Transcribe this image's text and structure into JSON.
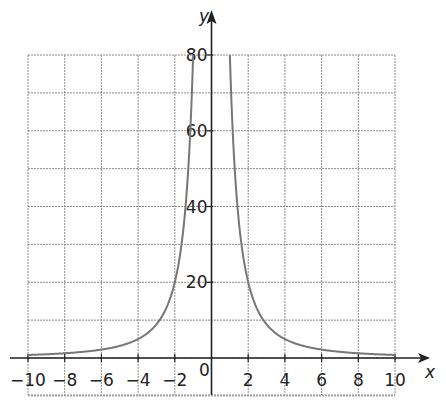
{
  "chart_data": {
    "type": "line",
    "title": "",
    "xlabel": "x",
    "ylabel": "y",
    "xlim": [
      -10,
      10
    ],
    "ylim": [
      -10,
      80
    ],
    "grid": true,
    "x_ticks": [
      -10,
      -8,
      -6,
      -4,
      -2,
      2,
      4,
      6,
      8,
      10
    ],
    "x_tick_labels": [
      "−10",
      "−8",
      "−6",
      "−4",
      "−2",
      "2",
      "4",
      "6",
      "8",
      "10"
    ],
    "y_ticks": [
      20,
      40,
      60,
      80
    ],
    "y_tick_labels": [
      "20",
      "40",
      "60",
      "80"
    ],
    "origin_label": "0",
    "function": "y = 80/x^2",
    "series": [
      {
        "name": "y = 80/x²",
        "x": [
          -10,
          -8,
          -6,
          -5,
          -4,
          -3,
          -2,
          -1.5,
          -1,
          1,
          1.5,
          2,
          3,
          4,
          5,
          6,
          8,
          10
        ],
        "y": [
          0.8,
          1.25,
          2.22,
          3.2,
          5,
          8.89,
          20,
          35.6,
          80,
          80,
          35.6,
          20,
          8.89,
          5,
          3.2,
          2.22,
          1.25,
          0.8
        ]
      }
    ],
    "colors": {
      "curve": "#777777",
      "grid": "#8a8a8a",
      "axes": "#222222"
    }
  }
}
